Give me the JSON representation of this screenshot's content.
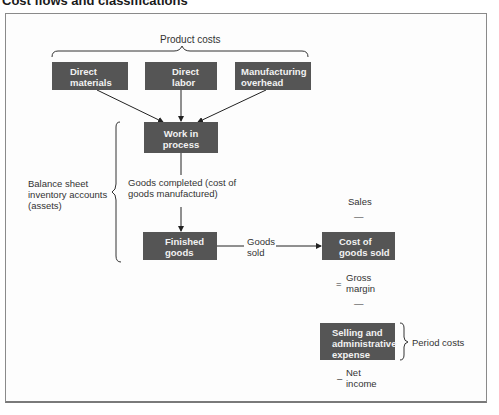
{
  "title": "Cost flows and classifications",
  "labels": {
    "product_costs": "Product costs",
    "balance_sheet": [
      "Balance sheet",
      "inventory accounts",
      "(assets)"
    ],
    "goods_completed": [
      "Goods completed (cost of",
      "goods manufactured)"
    ],
    "goods_sold": [
      "Goods",
      "sold"
    ],
    "sales": "Sales",
    "minus_1": "—",
    "equals": "=",
    "gross_margin": [
      "Gross",
      "margin"
    ],
    "minus_2": "—",
    "minus_3": "–",
    "net_income": [
      "Net",
      "income"
    ],
    "period_costs": "Period costs"
  },
  "boxes": {
    "direct_materials": [
      "Direct",
      "materials"
    ],
    "direct_labor": [
      "Direct",
      "labor"
    ],
    "manufacturing_overhead": [
      "Manufacturing",
      "overhead"
    ],
    "work_in_process": [
      "Work in",
      "process"
    ],
    "finished_goods": [
      "Finished",
      "goods"
    ],
    "cost_of_goods_sold": [
      "Cost of",
      "goods sold"
    ],
    "selling_admin": [
      "Selling and",
      "administrative",
      "expense"
    ]
  },
  "colors": {
    "box_fill": "#555555",
    "box_text": "#f2f2f2",
    "line": "#222222"
  }
}
